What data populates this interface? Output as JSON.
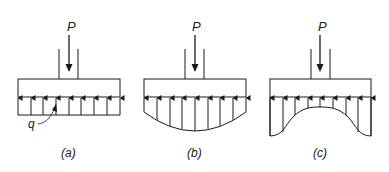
{
  "figure": {
    "type": "footing contact pressure distributions",
    "colors": {
      "line": "#1a1a1a",
      "background": "#ffffff"
    },
    "panels": [
      {
        "id": "a",
        "caption": "(a)",
        "load_label": "P",
        "pressure_label": "q",
        "distribution": "uniform"
      },
      {
        "id": "b",
        "caption": "(b)",
        "load_label": "P",
        "distribution": "parabolic-concave (max at center)"
      },
      {
        "id": "c",
        "caption": "(c)",
        "load_label": "P",
        "distribution": "saddle (max at edges)"
      }
    ]
  }
}
